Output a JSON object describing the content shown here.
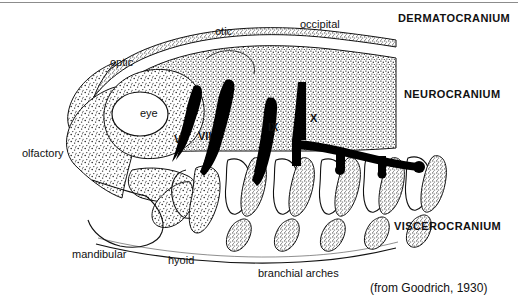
{
  "figure": {
    "title_caption": "(from Goodrich, 1930)",
    "colors": {
      "ink": "#111111",
      "stipple": "#1a1a1a",
      "background": "#ffffff",
      "top_rule": "#8c8c8c"
    },
    "part_labels": [
      {
        "id": "optic",
        "text": "optic",
        "x": 110,
        "y": 57
      },
      {
        "id": "otic",
        "text": "otic",
        "x": 215,
        "y": 26
      },
      {
        "id": "occipital",
        "text": "occipital",
        "x": 300,
        "y": 19
      },
      {
        "id": "eye",
        "text": "eye",
        "x": 140,
        "y": 113
      },
      {
        "id": "olfactory",
        "text": "olfactory",
        "x": 22,
        "y": 153
      },
      {
        "id": "mandibular",
        "text": "mandibular",
        "x": 72,
        "y": 254
      },
      {
        "id": "hyoid",
        "text": "hyoid",
        "x": 168,
        "y": 260
      },
      {
        "id": "branchial",
        "text": "branchial arches",
        "x": 258,
        "y": 273
      }
    ],
    "region_labels": [
      {
        "id": "dermatocranium",
        "text": "DERMATOCRANIUM",
        "x": 398,
        "y": 18
      },
      {
        "id": "neurocranium",
        "text": "NEUROCRANIUM",
        "x": 404,
        "y": 94
      },
      {
        "id": "viscerocranium",
        "text": "VISCEROCRANIUM",
        "x": 394,
        "y": 226
      }
    ],
    "nerve_labels": [
      {
        "id": "nerve-v",
        "text": "V",
        "x": 174,
        "y": 139
      },
      {
        "id": "nerve-vii",
        "text": "VII",
        "x": 198,
        "y": 136
      },
      {
        "id": "nerve-ix",
        "text": "IX",
        "x": 268,
        "y": 127
      },
      {
        "id": "nerve-x",
        "text": "X",
        "x": 310,
        "y": 118
      }
    ]
  }
}
